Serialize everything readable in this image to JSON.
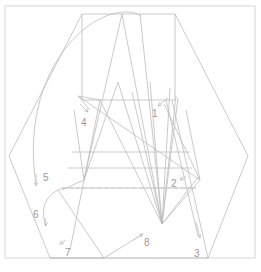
{
  "diagram": {
    "width": 261,
    "height": 272,
    "colors": {
      "line": "#bdbdbd",
      "label": "#9a9a9a",
      "frame": "#d6d6d6",
      "background": "#ffffff"
    },
    "frame": {
      "x": 5,
      "y": 6,
      "w": 250,
      "h": 252
    },
    "hexagon": "82,14 175,14 248,156 208,258 50,258 9,156",
    "rects": [
      {
        "name": "top-rectangle",
        "points": "82,14 175,14 175,100 82,100"
      },
      {
        "name": "mid-band-1",
        "points": "72,152 190,152 190,153 72,153"
      }
    ],
    "polylines": [
      "82,14 82,100 175,100 175,14",
      "72,152 190,152",
      "68,168 192,168",
      "62,188 196,188",
      "122,14 162,224 100,100 78,96 90,110",
      "122,14 84,180 118,82 162,224",
      "132,92 162,224 150,82",
      "140,14 162,224",
      "170,88 162,224 176,96",
      "178,98 162,224 199,176",
      "164,104 200,180 186,110",
      "78,96 200,180 162,224",
      "100,100 70,250",
      "166,100 198,236",
      "172,100 208,258",
      "58,190 104,258 50,258",
      "74,110 84,180 62,190",
      "104,258 143,234"
    ],
    "dashed": [
      {
        "name": "dashed-baseline",
        "points": "62,188 196,188"
      }
    ],
    "curves": [
      {
        "name": "top-arc-to-5",
        "d": "M 36,184 C 20,80 80,14 124,12 C 132,12 138,13 140,16"
      },
      {
        "name": "arc-6",
        "d": "M 62,188 C 44,196 40,210 46,226"
      }
    ],
    "arrows": [
      {
        "name": "arrow-1",
        "from": [
          168,
          98
        ],
        "to": [
          158,
          106
        ]
      },
      {
        "name": "arrow-2",
        "from": [
          186,
          176
        ],
        "to": [
          180,
          180
        ]
      },
      {
        "name": "arrow-3",
        "from": [
          196,
          222
        ],
        "to": [
          200,
          238
        ]
      },
      {
        "name": "arrow-4",
        "from": [
          80,
          104
        ],
        "to": [
          88,
          112
        ]
      },
      {
        "name": "arrow-5",
        "from": [
          36,
          174
        ],
        "to": [
          36,
          186
        ]
      },
      {
        "name": "arrow-6",
        "from": [
          45,
          218
        ],
        "to": [
          46,
          226
        ]
      },
      {
        "name": "arrow-7",
        "from": [
          66,
          240
        ],
        "to": [
          60,
          244
        ]
      },
      {
        "name": "arrow-8",
        "from": [
          133,
          240
        ],
        "to": [
          143,
          234
        ]
      }
    ],
    "labels": [
      {
        "name": "label-1",
        "text": "1",
        "x": 152,
        "y": 117
      },
      {
        "name": "label-2",
        "text": "2",
        "x": 171,
        "y": 187
      },
      {
        "name": "label-3",
        "text": "3",
        "x": 194,
        "y": 257
      },
      {
        "name": "label-4",
        "text": "4",
        "x": 81,
        "y": 126
      },
      {
        "name": "label-5",
        "text": "5",
        "x": 43,
        "y": 181
      },
      {
        "name": "label-6",
        "text": "6",
        "x": 33,
        "y": 218
      },
      {
        "name": "label-7",
        "text": "7",
        "x": 65,
        "y": 256
      },
      {
        "name": "label-8",
        "text": "8",
        "x": 144,
        "y": 246
      }
    ]
  }
}
